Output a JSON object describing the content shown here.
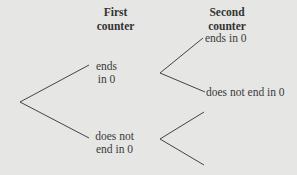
{
  "headers": {
    "first": [
      "First",
      "counter"
    ],
    "second": [
      "Second",
      "counter"
    ]
  },
  "nodes": {
    "first_ends": [
      "ends",
      "in 0"
    ],
    "first_not": [
      "does not",
      "end in 0"
    ],
    "second_ends": "ends in 0",
    "second_not": "does not end in 0"
  },
  "colors": {
    "background": "#e6e6e4",
    "line": "#444444",
    "text": "#3a3a3a"
  }
}
